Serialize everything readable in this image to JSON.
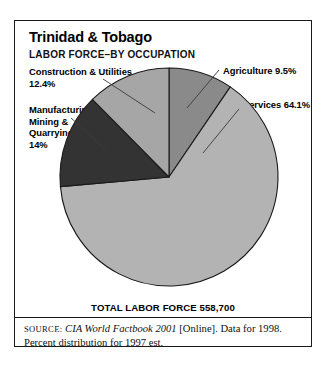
{
  "figure": {
    "country_title": "Trinidad & Tobago",
    "subtitle": "LABOR FORCE–BY OCCUPATION",
    "total_label": "TOTAL LABOR FORCE 558,700",
    "source": {
      "word": "SOURCE:",
      "publication": "CIA World Factbook 2001",
      "rest": " [Online]. Data for 1998. Percent distribution for 1997 est."
    }
  },
  "labels": {
    "construction": "Construction & Utilities\n12.4%",
    "manufacturing": "Manufacturing,\nMining &\nQuarrying\n14%",
    "agriculture": "Agriculture 9.5%",
    "services": "Services 64.1%"
  },
  "chart_data": {
    "type": "pie",
    "total": 558700,
    "total_text": "TOTAL LABOR FORCE 558,700",
    "categories": [
      "Agriculture",
      "Services",
      "Manufacturing, Mining & Quarrying",
      "Construction & Utilities"
    ],
    "values": [
      9.5,
      64.1,
      14.0,
      12.4
    ],
    "unit": "percent",
    "colors": [
      "#8a8a8a",
      "#b3b3b3",
      "#333333",
      "#a6a6a6"
    ],
    "start_angle_deg": 0,
    "direction": "clockwise",
    "legend": "none",
    "labels_on_slices": true,
    "slices": [
      {
        "name": "Agriculture",
        "value": 9.5,
        "label": "Agriculture 9.5%",
        "color": "#8a8a8a"
      },
      {
        "name": "Services",
        "value": 64.1,
        "label": "Services 64.1%",
        "color": "#b3b3b3"
      },
      {
        "name": "Manufacturing, Mining & Quarrying",
        "value": 14.0,
        "label": "Manufacturing, Mining & Quarrying 14%",
        "color": "#333333"
      },
      {
        "name": "Construction & Utilities",
        "value": 12.4,
        "label": "Construction & Utilities 12.4%",
        "color": "#a6a6a6"
      }
    ]
  }
}
